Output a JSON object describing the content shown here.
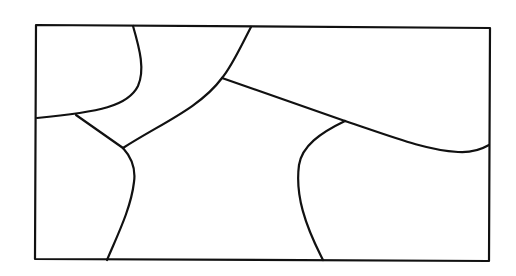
{
  "diagram": {
    "type": "region-partition",
    "stroke_color": "#111111",
    "background_color": "#ffffff",
    "frame": {
      "points": "36,25 490,28 489,261 35,259"
    },
    "boundaries": [
      {
        "name": "top-left-region-boundary",
        "d": "M133,26 C140,50 145,70 138,86 C128,106 100,112 37,118"
      },
      {
        "name": "left-junction-connector",
        "d": "M76,115 L123,148"
      },
      {
        "name": "central-upper-curve",
        "d": "M251,27 C240,48 232,66 222,78 C200,108 160,124 123,148"
      },
      {
        "name": "diagonal-divider",
        "d": "M222,78 L345,121"
      },
      {
        "name": "right-region-boundary",
        "d": "M345,121 C390,136 425,150 458,152 C472,153 482,149 489,145"
      },
      {
        "name": "center-right-curve",
        "d": "M345,121 C320,133 302,146 299,165 C295,195 305,225 323,260"
      },
      {
        "name": "center-left-curve",
        "d": "M123,148 C132,158 136,168 134,182 C131,208 118,234 107,260"
      }
    ]
  }
}
